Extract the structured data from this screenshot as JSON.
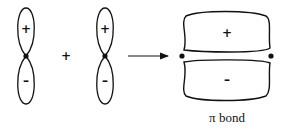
{
  "diagram": {
    "orbital_1": {
      "upper_sign": "+",
      "lower_sign": "–"
    },
    "operator": "+",
    "orbital_2": {
      "upper_sign": "+",
      "lower_sign": "–"
    },
    "arrow": "right-arrow",
    "pi_bond": {
      "upper_sign": "+",
      "lower_sign": "–",
      "label": "π bond"
    },
    "colors": {
      "stroke": "#111111",
      "background": "#ffffff"
    }
  }
}
